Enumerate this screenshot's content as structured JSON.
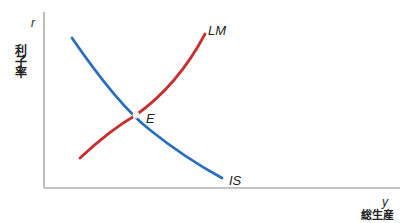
{
  "diagram": {
    "type": "IS-LM model",
    "axes": {
      "y_axis": {
        "symbol": "r",
        "title": "利子率"
      },
      "x_axis": {
        "symbol": "y",
        "title": "総生産"
      }
    },
    "curves": [
      {
        "name": "IS",
        "label": "IS",
        "color": "#2a6fbd",
        "slope": "downward"
      },
      {
        "name": "LM",
        "label": "LM",
        "color": "#c8302f",
        "slope": "upward"
      }
    ],
    "equilibrium": {
      "label": "E"
    },
    "colors": {
      "axis": "#9a9a9a",
      "text": "#222222"
    }
  }
}
